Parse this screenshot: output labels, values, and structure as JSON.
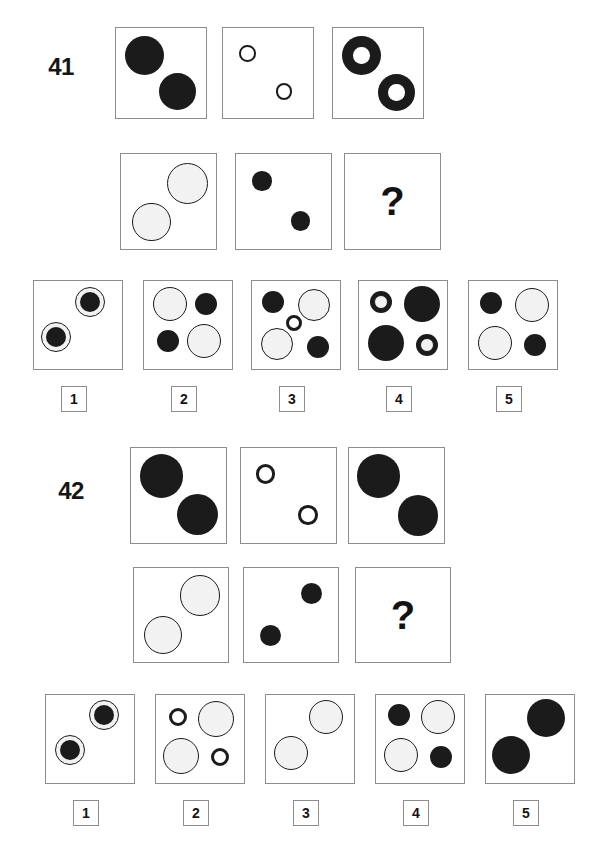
{
  "page": {
    "width": 608,
    "height": 858,
    "background": "#ffffff",
    "kind": "visual-analogy-test-page"
  },
  "colors": {
    "dark_fill": "#1b1b1b",
    "light_fill": "#f2f2f2",
    "outline": "#1b1b1b",
    "cell_border": "#8d8d8d",
    "text": "#141414"
  },
  "puzzles": [
    {
      "id": "41",
      "number_label": "41",
      "question_mark": "?",
      "matrix": {
        "row1": [
          {
            "name": "cell-a1",
            "shapes": [
              {
                "kind": "filled-dark-circle",
                "cx": 28,
                "cy": 27,
                "r": 19,
                "fill": "dark",
                "stroke": 0
              },
              {
                "kind": "filled-dark-circle",
                "cx": 60,
                "cy": 62,
                "r": 18,
                "fill": "dark",
                "stroke": 0
              }
            ]
          },
          {
            "name": "cell-a2",
            "shapes": [
              {
                "kind": "thin-ring",
                "cx": 24,
                "cy": 25,
                "r": 8,
                "fill": "none",
                "stroke": 2.5
              },
              {
                "kind": "thin-ring",
                "cx": 60,
                "cy": 62,
                "r": 8,
                "fill": "none",
                "stroke": 2.5
              }
            ]
          },
          {
            "name": "cell-a3",
            "shapes": [
              {
                "kind": "thick-dark-annulus",
                "cx": 28,
                "cy": 27,
                "r": 19,
                "fill": "dark",
                "hole": 8
              },
              {
                "kind": "thick-dark-annulus",
                "cx": 62,
                "cy": 63,
                "r": 18,
                "fill": "dark",
                "hole": 8
              }
            ]
          }
        ],
        "row2": [
          {
            "name": "cell-b1",
            "shapes": [
              {
                "kind": "outlined-light-circle",
                "cx": 62,
                "cy": 27,
                "r": 19,
                "fill": "light",
                "stroke": 1.4
              },
              {
                "kind": "outlined-light-circle",
                "cx": 28,
                "cy": 63,
                "r": 18,
                "fill": "light",
                "stroke": 1.4
              }
            ]
          },
          {
            "name": "cell-b2",
            "shapes": [
              {
                "kind": "filled-dark-circle",
                "cx": 24,
                "cy": 25,
                "r": 9,
                "fill": "dark",
                "stroke": 0
              },
              {
                "kind": "filled-dark-circle",
                "cx": 60,
                "cy": 62,
                "r": 9,
                "fill": "dark",
                "stroke": 0
              }
            ]
          },
          {
            "name": "cell-b3-answer",
            "shapes": [],
            "is_answer_slot": true
          }
        ]
      },
      "options": [
        {
          "label": "1",
          "name": "option-1",
          "shapes": [
            {
              "kind": "light-ring-dark-core",
              "cx": 56,
              "cy": 21,
              "r": 15,
              "core": 10
            },
            {
              "kind": "light-ring-dark-core",
              "cx": 22,
              "cy": 56,
              "r": 15,
              "core": 10
            }
          ]
        },
        {
          "label": "2",
          "name": "option-2",
          "shapes": [
            {
              "kind": "outlined-light-circle",
              "cx": 26,
              "cy": 23,
              "r": 17,
              "fill": "light",
              "stroke": 1.4
            },
            {
              "kind": "filled-dark-circle",
              "cx": 62,
              "cy": 23,
              "r": 11,
              "fill": "dark",
              "stroke": 0
            },
            {
              "kind": "filled-dark-circle",
              "cx": 24,
              "cy": 60,
              "r": 11,
              "fill": "dark",
              "stroke": 0
            },
            {
              "kind": "outlined-light-circle",
              "cx": 60,
              "cy": 60,
              "r": 17,
              "fill": "light",
              "stroke": 1.4
            }
          ]
        },
        {
          "label": "3",
          "name": "option-3",
          "shapes": [
            {
              "kind": "filled-dark-circle",
              "cx": 21,
              "cy": 21,
              "r": 11,
              "fill": "dark",
              "stroke": 0
            },
            {
              "kind": "outlined-light-circle",
              "cx": 62,
              "cy": 24,
              "r": 16,
              "fill": "light",
              "stroke": 1.4
            },
            {
              "kind": "thin-ring",
              "cx": 42,
              "cy": 42,
              "r": 8,
              "fill": "none",
              "stroke": 3
            },
            {
              "kind": "outlined-light-circle",
              "cx": 25,
              "cy": 63,
              "r": 16,
              "fill": "light",
              "stroke": 1.4
            },
            {
              "kind": "filled-dark-circle",
              "cx": 66,
              "cy": 66,
              "r": 11,
              "fill": "dark",
              "stroke": 0
            }
          ]
        },
        {
          "label": "4",
          "name": "option-4",
          "shapes": [
            {
              "kind": "dark-ring-light-core",
              "cx": 22,
              "cy": 21,
              "r": 11,
              "core": 7
            },
            {
              "kind": "filled-dark-circle",
              "cx": 63,
              "cy": 23,
              "r": 18,
              "fill": "dark",
              "stroke": 0
            },
            {
              "kind": "filled-dark-circle",
              "cx": 27,
              "cy": 62,
              "r": 18,
              "fill": "dark",
              "stroke": 0
            },
            {
              "kind": "dark-ring-light-core",
              "cx": 68,
              "cy": 64,
              "r": 11,
              "core": 7
            }
          ]
        },
        {
          "label": "5",
          "name": "option-5",
          "shapes": [
            {
              "kind": "filled-dark-circle",
              "cx": 22,
              "cy": 22,
              "r": 11,
              "fill": "dark",
              "stroke": 0
            },
            {
              "kind": "outlined-light-circle",
              "cx": 63,
              "cy": 24,
              "r": 17,
              "fill": "light",
              "stroke": 1.4
            },
            {
              "kind": "outlined-light-circle",
              "cx": 26,
              "cy": 62,
              "r": 17,
              "fill": "light",
              "stroke": 1.4
            },
            {
              "kind": "filled-dark-circle",
              "cx": 66,
              "cy": 64,
              "r": 11,
              "fill": "dark",
              "stroke": 0
            }
          ]
        }
      ]
    },
    {
      "id": "42",
      "number_label": "42",
      "question_mark": "?",
      "matrix": {
        "row1": [
          {
            "name": "cell-a1",
            "shapes": [
              {
                "kind": "filled-dark-circle",
                "cx": 28,
                "cy": 26,
                "r": 20,
                "fill": "dark",
                "stroke": 0
              },
              {
                "kind": "filled-dark-circle",
                "cx": 62,
                "cy": 62,
                "r": 19,
                "fill": "dark",
                "stroke": 0
              }
            ]
          },
          {
            "name": "cell-a2",
            "shapes": [
              {
                "kind": "thin-ring",
                "cx": 23,
                "cy": 24,
                "r": 9,
                "fill": "none",
                "stroke": 3
              },
              {
                "kind": "thin-ring",
                "cx": 62,
                "cy": 62,
                "r": 9,
                "fill": "none",
                "stroke": 3
              }
            ]
          },
          {
            "name": "cell-a3",
            "shapes": [
              {
                "kind": "filled-dark-circle",
                "cx": 27,
                "cy": 26,
                "r": 20,
                "fill": "dark",
                "stroke": 0
              },
              {
                "kind": "filled-dark-circle",
                "cx": 64,
                "cy": 63,
                "r": 19,
                "fill": "dark",
                "stroke": 0
              }
            ]
          }
        ],
        "row2": [
          {
            "name": "cell-b1",
            "shapes": [
              {
                "kind": "outlined-light-circle",
                "cx": 62,
                "cy": 26,
                "r": 19,
                "fill": "light",
                "stroke": 1.4
              },
              {
                "kind": "outlined-light-circle",
                "cx": 27,
                "cy": 63,
                "r": 18,
                "fill": "light",
                "stroke": 1.4
              }
            ]
          },
          {
            "name": "cell-b2",
            "shapes": [
              {
                "kind": "filled-dark-circle",
                "cx": 63,
                "cy": 24,
                "r": 10,
                "fill": "dark",
                "stroke": 0
              },
              {
                "kind": "filled-dark-circle",
                "cx": 25,
                "cy": 63,
                "r": 10,
                "fill": "dark",
                "stroke": 0
              }
            ]
          },
          {
            "name": "cell-b3-answer",
            "shapes": [],
            "is_answer_slot": true
          }
        ]
      },
      "options": [
        {
          "label": "1",
          "name": "option-1",
          "shapes": [
            {
              "kind": "light-ring-dark-core",
              "cx": 58,
              "cy": 20,
              "r": 15,
              "core": 10
            },
            {
              "kind": "light-ring-dark-core",
              "cx": 24,
              "cy": 55,
              "r": 15,
              "core": 10
            }
          ]
        },
        {
          "label": "2",
          "name": "option-2",
          "shapes": [
            {
              "kind": "thin-ring",
              "cx": 22,
              "cy": 22,
              "r": 9,
              "fill": "none",
              "stroke": 3
            },
            {
              "kind": "outlined-light-circle",
              "cx": 60,
              "cy": 24,
              "r": 18,
              "fill": "light",
              "stroke": 1.4
            },
            {
              "kind": "outlined-light-circle",
              "cx": 25,
              "cy": 61,
              "r": 18,
              "fill": "light",
              "stroke": 1.4
            },
            {
              "kind": "thin-ring",
              "cx": 64,
              "cy": 62,
              "r": 9,
              "fill": "none",
              "stroke": 3
            }
          ]
        },
        {
          "label": "3",
          "name": "option-3",
          "shapes": [
            {
              "kind": "outlined-light-circle",
              "cx": 60,
              "cy": 22,
              "r": 17,
              "fill": "light",
              "stroke": 1.4
            },
            {
              "kind": "outlined-light-circle",
              "cx": 25,
              "cy": 58,
              "r": 17,
              "fill": "light",
              "stroke": 1.4
            }
          ]
        },
        {
          "label": "4",
          "name": "option-4",
          "shapes": [
            {
              "kind": "filled-dark-circle",
              "cx": 23,
              "cy": 20,
              "r": 11,
              "fill": "dark",
              "stroke": 0
            },
            {
              "kind": "outlined-light-circle",
              "cx": 62,
              "cy": 22,
              "r": 17,
              "fill": "light",
              "stroke": 1.4
            },
            {
              "kind": "outlined-light-circle",
              "cx": 25,
              "cy": 60,
              "r": 17,
              "fill": "light",
              "stroke": 1.4
            },
            {
              "kind": "filled-dark-circle",
              "cx": 65,
              "cy": 62,
              "r": 11,
              "fill": "dark",
              "stroke": 0
            }
          ]
        },
        {
          "label": "5",
          "name": "option-5",
          "shapes": [
            {
              "kind": "filled-dark-circle",
              "cx": 60,
              "cy": 23,
              "r": 19,
              "fill": "dark",
              "stroke": 0
            },
            {
              "kind": "filled-dark-circle",
              "cx": 25,
              "cy": 60,
              "r": 19,
              "fill": "dark",
              "stroke": 0
            }
          ]
        }
      ]
    }
  ],
  "geometry": {
    "p41": {
      "badge": {
        "x": 30,
        "y": 36,
        "w": 62,
        "h": 62
      },
      "row1": {
        "y": 27,
        "size": 92,
        "xs": [
          115,
          222,
          332
        ]
      },
      "row2": {
        "y": 153,
        "size": 97,
        "xs": [
          120,
          235,
          344
        ]
      },
      "options": {
        "y": 280,
        "size": 90,
        "xs": [
          33,
          143,
          251,
          358,
          468
        ]
      },
      "labels": {
        "y": 386,
        "size": 26,
        "xs": [
          61,
          171,
          279,
          386,
          496
        ]
      }
    },
    "p42": {
      "badge": {
        "x": 38,
        "y": 460,
        "w": 66,
        "h": 62
      },
      "row1": {
        "y": 447,
        "size": 97,
        "xs": [
          130,
          240,
          348
        ]
      },
      "row2": {
        "y": 567,
        "size": 96,
        "xs": [
          133,
          243,
          355
        ]
      },
      "options": {
        "y": 694,
        "size": 90,
        "xs": [
          45,
          155,
          265,
          375,
          485
        ]
      },
      "labels": {
        "y": 800,
        "size": 26,
        "xs": [
          73,
          183,
          293,
          403,
          513
        ]
      }
    }
  }
}
